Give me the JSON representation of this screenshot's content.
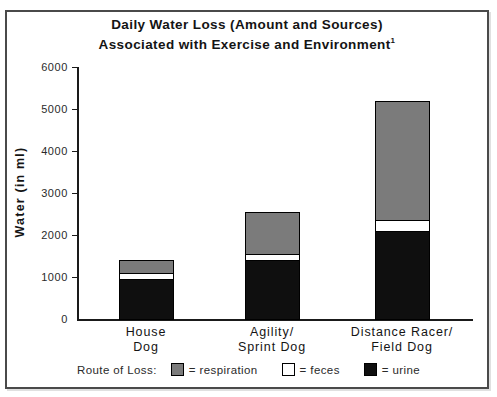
{
  "page": {
    "title_line1": "Daily Water Loss (Amount and Sources)",
    "title_line2": "Associated with Exercise and Environment",
    "footnote_marker": "1"
  },
  "colors": {
    "respiration": "#7b7b7b",
    "feces": "#ffffff",
    "urine": "#0f0f0f",
    "axis": "#1a1a1a",
    "panel_border": "#4a4a4a"
  },
  "legend": {
    "label": "Route of Loss:",
    "items": [
      {
        "name": "respiration",
        "text": "= respiration",
        "color": "#7b7b7b"
      },
      {
        "name": "feces",
        "text": "= feces",
        "color": "#ffffff"
      },
      {
        "name": "urine",
        "text": "= urine",
        "color": "#0f0f0f"
      }
    ]
  },
  "chart_data": {
    "type": "bar",
    "stacked": true,
    "categories": [
      "House Dog",
      "Agility/Sprint Dog",
      "Distance Racer/Field Dog"
    ],
    "category_lines": [
      [
        "House",
        "Dog"
      ],
      [
        "Agility/",
        "Sprint Dog"
      ],
      [
        "Distance Racer/",
        "Field Dog"
      ]
    ],
    "series": [
      {
        "name": "urine",
        "color": "#0f0f0f",
        "values": [
          950,
          1400,
          2100
        ]
      },
      {
        "name": "feces",
        "color": "#ffffff",
        "values": [
          150,
          150,
          250
        ]
      },
      {
        "name": "respiration",
        "color": "#7b7b7b",
        "values": [
          300,
          1000,
          2850
        ]
      }
    ],
    "totals": [
      1400,
      2550,
      5200
    ],
    "xlabel": "",
    "ylabel": "Water (in ml)",
    "ylim": [
      0,
      6000
    ],
    "yticks": [
      0,
      1000,
      2000,
      3000,
      4000,
      5000,
      6000
    ],
    "grid": false,
    "legend_position": "bottom"
  }
}
